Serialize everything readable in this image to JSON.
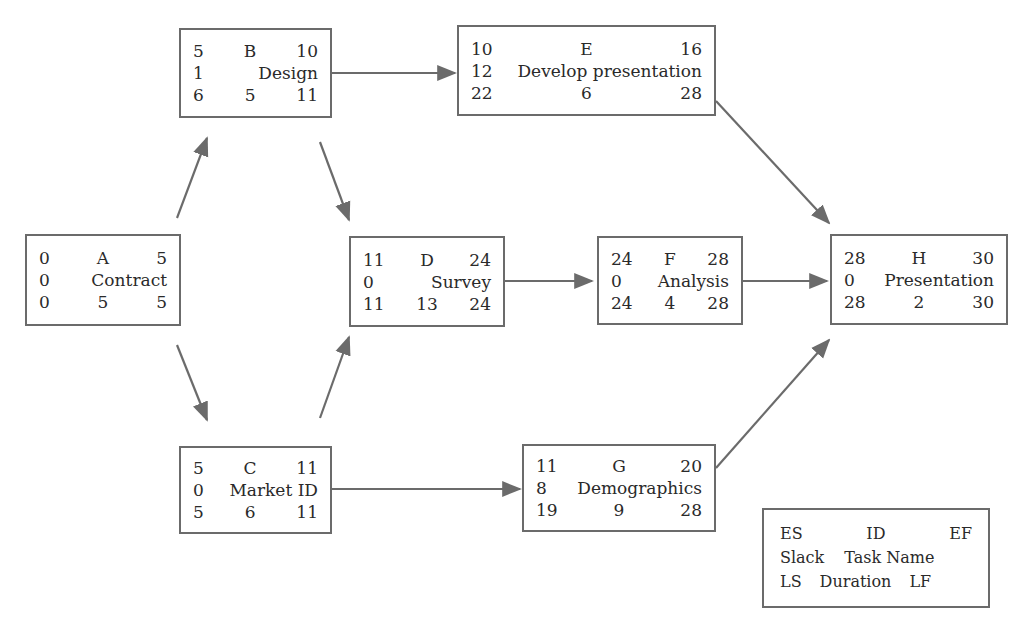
{
  "diagram": {
    "type": "activity-on-node network (critical path)",
    "legend": {
      "row1": [
        "ES",
        "ID",
        "EF"
      ],
      "row2": [
        "Slack",
        "Task Name"
      ],
      "row3": [
        "LS",
        "Duration",
        "LF"
      ]
    },
    "nodes": [
      {
        "id": "A",
        "name": "Contract",
        "es": "0",
        "ef": "5",
        "slack": "0",
        "ls": "0",
        "duration": "5",
        "lf": "5"
      },
      {
        "id": "B",
        "name": "Design",
        "es": "5",
        "ef": "10",
        "slack": "1",
        "ls": "6",
        "duration": "5",
        "lf": "11"
      },
      {
        "id": "C",
        "name": "Market ID",
        "es": "5",
        "ef": "11",
        "slack": "0",
        "ls": "5",
        "duration": "6",
        "lf": "11"
      },
      {
        "id": "D",
        "name": "Survey",
        "es": "11",
        "ef": "24",
        "slack": "0",
        "ls": "11",
        "duration": "13",
        "lf": "24"
      },
      {
        "id": "E",
        "name": "Develop presentation",
        "es": "10",
        "ef": "16",
        "slack": "12",
        "ls": "22",
        "duration": "6",
        "lf": "28"
      },
      {
        "id": "F",
        "name": "Analysis",
        "es": "24",
        "ef": "28",
        "slack": "0",
        "ls": "24",
        "duration": "4",
        "lf": "28"
      },
      {
        "id": "G",
        "name": "Demographics",
        "es": "11",
        "ef": "20",
        "slack": "8",
        "ls": "19",
        "duration": "9",
        "lf": "28"
      },
      {
        "id": "H",
        "name": "Presentation",
        "es": "28",
        "ef": "30",
        "slack": "0",
        "ls": "28",
        "duration": "2",
        "lf": "30"
      }
    ],
    "edges": [
      {
        "from": "A",
        "to": "B"
      },
      {
        "from": "A",
        "to": "C"
      },
      {
        "from": "B",
        "to": "D"
      },
      {
        "from": "B",
        "to": "E"
      },
      {
        "from": "C",
        "to": "D"
      },
      {
        "from": "C",
        "to": "G"
      },
      {
        "from": "D",
        "to": "F"
      },
      {
        "from": "E",
        "to": "H"
      },
      {
        "from": "F",
        "to": "H"
      },
      {
        "from": "G",
        "to": "H"
      }
    ],
    "colors": {
      "line": "#6b6b6b",
      "text": "#2a2a2a",
      "background": "#ffffff"
    }
  }
}
